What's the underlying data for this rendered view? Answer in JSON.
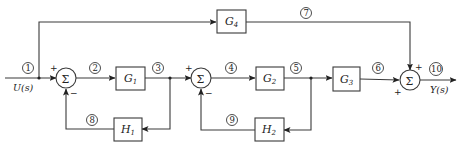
{
  "diagram": {
    "type": "control-system-block-diagram",
    "input": {
      "label": "U(s)"
    },
    "output": {
      "label": "Y(s)"
    },
    "blocks": [
      {
        "id": "G1",
        "base": "G",
        "sub": "1"
      },
      {
        "id": "G2",
        "base": "G",
        "sub": "2"
      },
      {
        "id": "G3",
        "base": "G",
        "sub": "3"
      },
      {
        "id": "G4",
        "base": "G",
        "sub": "4"
      },
      {
        "id": "H1",
        "base": "H",
        "sub": "1"
      },
      {
        "id": "H2",
        "base": "H",
        "sub": "2"
      }
    ],
    "summing_junctions": [
      {
        "id": "S1",
        "symbol": "Σ",
        "signs": {
          "left": "+",
          "bottom": "−"
        }
      },
      {
        "id": "S2",
        "symbol": "Σ",
        "signs": {
          "left": "+",
          "bottom": "−"
        }
      },
      {
        "id": "S3",
        "symbol": "Σ",
        "signs": {
          "top": "+",
          "left": "+"
        }
      }
    ],
    "signal_nodes": [
      "1",
      "2",
      "3",
      "4",
      "5",
      "6",
      "7",
      "8",
      "9",
      "10"
    ],
    "edges": [
      {
        "from": "U(s)",
        "to": "S1",
        "node": "1"
      },
      {
        "from": "node1",
        "to": "G4",
        "note": "feedforward branch"
      },
      {
        "from": "S1",
        "to": "G1",
        "node": "2"
      },
      {
        "from": "G1",
        "to": "S2",
        "node": "3"
      },
      {
        "from": "node3",
        "to": "H1"
      },
      {
        "from": "H1",
        "to": "S1",
        "node": "8",
        "sign": "−"
      },
      {
        "from": "S2",
        "to": "G2",
        "node": "4"
      },
      {
        "from": "G2",
        "to": "G3",
        "node": "5"
      },
      {
        "from": "node5",
        "to": "H2"
      },
      {
        "from": "H2",
        "to": "S2",
        "node": "9",
        "sign": "−"
      },
      {
        "from": "G3",
        "to": "S3",
        "node": "6",
        "sign": "+"
      },
      {
        "from": "G4",
        "to": "S3",
        "node": "7",
        "sign": "+"
      },
      {
        "from": "S3",
        "to": "Y(s)",
        "node": "10"
      }
    ]
  }
}
